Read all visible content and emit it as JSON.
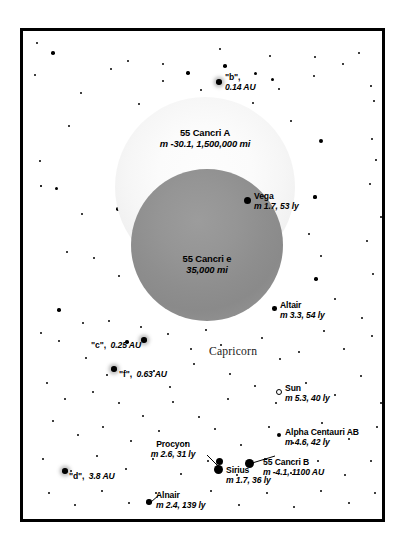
{
  "chart_data": {
    "type": "scatter",
    "constellation_label": "Capricorn",
    "xlabel": "",
    "ylabel": "",
    "grid": false,
    "legend": "none",
    "bodies": [
      {
        "name": "55 Cancri A",
        "detail": "m -30.1, 1,500,000 mi",
        "magnitude": -30.1,
        "apparent_size_mi": 1500000,
        "kind": "host-star-disc",
        "shade": "#f6f6f6"
      },
      {
        "name": "55 Cancri e",
        "detail": "35,000 mi",
        "apparent_size_mi": 35000,
        "kind": "planet-disc",
        "shade": "#8e8e8e"
      }
    ],
    "planets": [
      {
        "name": "\"b\"",
        "detail": "0.14 AU",
        "distance_au": 0.14
      },
      {
        "name": "\"c\"",
        "detail": "0.25 AU",
        "distance_au": 0.25
      },
      {
        "name": "\"f\"",
        "detail": "0.63 AU",
        "distance_au": 0.63
      },
      {
        "name": "\"d\"",
        "detail": "3.8 AU",
        "distance_au": 3.8
      }
    ],
    "stars": [
      {
        "name": "Vega",
        "detail": "m 1.7, 53 ly",
        "magnitude": 1.7,
        "distance_ly": 53
      },
      {
        "name": "Altair",
        "detail": "m 3.3, 54 ly",
        "magnitude": 3.3,
        "distance_ly": 54
      },
      {
        "name": "Sun",
        "detail": "m 5.3, 40 ly",
        "magnitude": 5.3,
        "distance_ly": 40
      },
      {
        "name": "Alpha Centauri AB",
        "detail": "m 4.6, 42 ly",
        "magnitude": 4.6,
        "distance_ly": 42
      },
      {
        "name": "Procyon",
        "detail": "m 2.6, 31 ly",
        "magnitude": 2.6,
        "distance_ly": 31
      },
      {
        "name": "Sirius",
        "detail": "m 1.7, 36 ly",
        "magnitude": 1.7,
        "distance_ly": 36
      },
      {
        "name": "Alnair",
        "detail": "m 2.4, 139 ly",
        "magnitude": 2.4,
        "distance_ly": 139
      },
      {
        "name": "55 Cancri B",
        "detail": "m -4.1, 1100 AU",
        "magnitude": -4.1,
        "distance_au": 1100
      }
    ]
  },
  "labels": {
    "planet_b": {
      "name": "\"b\",",
      "detail": "0.14 AU"
    },
    "planet_c": {
      "name": "\"c\",",
      "detail": "0.25 AU"
    },
    "planet_f": {
      "name": "\"f\",",
      "detail": "0.63 AU"
    },
    "planet_d": {
      "name": "\"d\",",
      "detail": "3.8 AU"
    },
    "cancri_a": {
      "name": "55 Cancri A",
      "detail": "m -30.1, 1,500,000 mi"
    },
    "cancri_e": {
      "name": "55 Cancri e",
      "detail": "35,000 mi"
    },
    "cancri_b": {
      "name": "55 Cancri B",
      "detail": "m -4.1, 1100 AU"
    },
    "vega": {
      "name": "Vega",
      "detail": "m 1.7, 53 ly"
    },
    "altair": {
      "name": "Altair",
      "detail": "m 3.3, 54 ly"
    },
    "sun": {
      "name": "Sun",
      "detail": "m 5.3, 40 ly"
    },
    "alpha_centauri": {
      "name": "Alpha Centauri AB",
      "detail": "m 4.6, 42 ly"
    },
    "procyon": {
      "name": "Procyon",
      "detail": "m 2.6, 31 ly"
    },
    "sirius": {
      "name": "Sirius",
      "detail": "m 1.7, 36 ly"
    },
    "alnair": {
      "name": "Alnair",
      "detail": "m 2.4, 139 ly"
    },
    "constellation": "Capricorn"
  },
  "colors": {
    "background": "#ffffff",
    "frame": "#000000",
    "star": "#000000",
    "host_disc": "#f6f6f6",
    "planet_disc": "#8e8e8e",
    "text": "#000000"
  },
  "starfield": [
    [
      14,
      12,
      2.0
    ],
    [
      30,
      22,
      3.6
    ],
    [
      46,
      95,
      2.2
    ],
    [
      12,
      44,
      2.4
    ],
    [
      17,
      130,
      1.8
    ],
    [
      33,
      157,
      3.0
    ],
    [
      18,
      155,
      1.6
    ],
    [
      58,
      62,
      2.0
    ],
    [
      88,
      38,
      2.0
    ],
    [
      105,
      30,
      2.6
    ],
    [
      140,
      33,
      2.0
    ],
    [
      116,
      73,
      2.2
    ],
    [
      140,
      50,
      2.0
    ],
    [
      165,
      42,
      3.4
    ],
    [
      178,
      59,
      2.4
    ],
    [
      197,
      18,
      2.0
    ],
    [
      202,
      35,
      3.6
    ],
    [
      215,
      81,
      2.2
    ],
    [
      230,
      72,
      2.4
    ],
    [
      247,
      25,
      2.0
    ],
    [
      232,
      42,
      3.0
    ],
    [
      249,
      48,
      3.0
    ],
    [
      256,
      58,
      2.0
    ],
    [
      292,
      26,
      2.0
    ],
    [
      291,
      45,
      2.2
    ],
    [
      268,
      90,
      2.2
    ],
    [
      320,
      33,
      1.9
    ],
    [
      336,
      22,
      2.0
    ],
    [
      348,
      55,
      1.8
    ],
    [
      351,
      70,
      1.9
    ],
    [
      298,
      110,
      3.9
    ],
    [
      349,
      108,
      2.0
    ],
    [
      353,
      129,
      1.8
    ],
    [
      59,
      183,
      2.0
    ],
    [
      95,
      178,
      3.6
    ],
    [
      44,
      221,
      2.2
    ],
    [
      71,
      227,
      2.4
    ],
    [
      96,
      245,
      2.3
    ],
    [
      36,
      279,
      3.4
    ],
    [
      86,
      290,
      2.0
    ],
    [
      18,
      302,
      2.0
    ],
    [
      292,
      166,
      3.2
    ],
    [
      262,
      174,
      2.0
    ],
    [
      286,
      203,
      2.0
    ],
    [
      298,
      225,
      2.2
    ],
    [
      293,
      248,
      3.4
    ],
    [
      347,
      153,
      2.2
    ],
    [
      358,
      186,
      2.0
    ],
    [
      344,
      210,
      2.0
    ],
    [
      350,
      243,
      2.0
    ],
    [
      312,
      268,
      2.0
    ],
    [
      339,
      287,
      2.0
    ],
    [
      36,
      310,
      2.2
    ],
    [
      60,
      292,
      2.0
    ],
    [
      104,
      311,
      3.4
    ],
    [
      118,
      296,
      2.2
    ],
    [
      145,
      303,
      2.4
    ],
    [
      168,
      318,
      2.3
    ],
    [
      183,
      299,
      2.0
    ],
    [
      198,
      314,
      2.0
    ],
    [
      63,
      327,
      2.0
    ],
    [
      84,
      344,
      2.2
    ],
    [
      131,
      340,
      2.6
    ],
    [
      147,
      356,
      2.0
    ],
    [
      171,
      333,
      2.0
    ],
    [
      207,
      343,
      2.2
    ],
    [
      239,
      307,
      2.0
    ],
    [
      257,
      328,
      2.3
    ],
    [
      276,
      321,
      2.0
    ],
    [
      301,
      300,
      2.0
    ],
    [
      321,
      318,
      2.2
    ],
    [
      349,
      305,
      2.0
    ],
    [
      24,
      352,
      2.0
    ],
    [
      42,
      368,
      2.2
    ],
    [
      70,
      361,
      2.0
    ],
    [
      96,
      372,
      2.4
    ],
    [
      120,
      385,
      2.2
    ],
    [
      150,
      371,
      2.0
    ],
    [
      176,
      386,
      2.2
    ],
    [
      205,
      368,
      2.0
    ],
    [
      232,
      355,
      2.0
    ],
    [
      253,
      372,
      2.0
    ],
    [
      283,
      352,
      2.0
    ],
    [
      312,
      364,
      2.2
    ],
    [
      338,
      345,
      2.0
    ],
    [
      358,
      372,
      2.0
    ],
    [
      30,
      390,
      2.2
    ],
    [
      55,
      404,
      2.0
    ],
    [
      80,
      396,
      2.3
    ],
    [
      108,
      410,
      2.0
    ],
    [
      136,
      400,
      2.2
    ],
    [
      163,
      412,
      2.0
    ],
    [
      192,
      398,
      2.2
    ],
    [
      218,
      414,
      2.0
    ],
    [
      246,
      396,
      2.0
    ],
    [
      270,
      412,
      2.2
    ],
    [
      299,
      392,
      2.0
    ],
    [
      326,
      408,
      2.2
    ],
    [
      354,
      396,
      2.0
    ],
    [
      20,
      428,
      2.0
    ],
    [
      48,
      440,
      2.2
    ],
    [
      74,
      425,
      2.0
    ],
    [
      103,
      438,
      2.3
    ],
    [
      130,
      428,
      2.0
    ],
    [
      158,
      443,
      2.2
    ],
    [
      185,
      430,
      2.0
    ],
    [
      214,
      444,
      2.2
    ],
    [
      242,
      428,
      2.0
    ],
    [
      268,
      442,
      2.0
    ],
    [
      295,
      430,
      2.2
    ],
    [
      322,
      444,
      2.0
    ],
    [
      348,
      430,
      2.0
    ],
    [
      26,
      462,
      2.2
    ],
    [
      52,
      474,
      2.0
    ],
    [
      79,
      460,
      2.2
    ],
    [
      106,
      472,
      2.0
    ],
    [
      133,
      462,
      2.3
    ],
    [
      161,
      476,
      2.0
    ],
    [
      188,
      460,
      2.2
    ],
    [
      216,
      474,
      2.0
    ],
    [
      244,
      462,
      2.0
    ],
    [
      271,
      476,
      2.2
    ],
    [
      298,
      460,
      2.0
    ],
    [
      326,
      472,
      2.2
    ],
    [
      352,
      462,
      2.0
    ]
  ]
}
